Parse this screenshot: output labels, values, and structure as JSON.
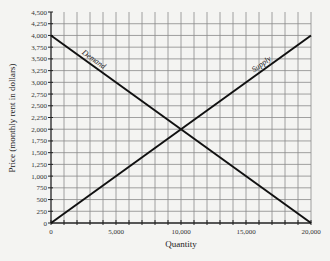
{
  "chart_data": {
    "type": "line",
    "title": "",
    "xlabel": "Quantity",
    "ylabel": "Price (monthly rent in dollars)",
    "xlim": [
      0,
      20000
    ],
    "ylim": [
      0,
      4500
    ],
    "x_ticks": [
      0,
      5000,
      10000,
      15000,
      20000
    ],
    "x_tick_labels": [
      "0",
      "5,000",
      "10,000",
      "15,000",
      "20,000"
    ],
    "x_minor_step": 1000,
    "y_ticks": [
      0,
      250,
      500,
      750,
      1000,
      1250,
      1500,
      1750,
      2000,
      2250,
      2500,
      2750,
      3000,
      3250,
      3500,
      3750,
      4000,
      4250,
      4500
    ],
    "y_tick_labels": [
      "0",
      "250",
      "500",
      "750",
      "1,000",
      "1,250",
      "1,500",
      "1,750",
      "2,000",
      "2,250",
      "2,500",
      "2,750",
      "3,000",
      "3,250",
      "3,500",
      "3,750",
      "4,000",
      "4,250",
      "4,500"
    ],
    "grid": true,
    "legend": "none (curves labeled inline)",
    "series": [
      {
        "name": "Demand",
        "x": [
          0,
          20000
        ],
        "y": [
          4000,
          0
        ]
      },
      {
        "name": "Supply",
        "x": [
          0,
          20000
        ],
        "y": [
          0,
          4000
        ]
      }
    ],
    "annotations": [
      {
        "text": "Demand",
        "position": "along demand curve near upper left"
      },
      {
        "text": "Supply",
        "position": "along supply curve near upper right"
      }
    ],
    "equilibrium": {
      "quantity": 10000,
      "price": 2000
    }
  },
  "colors": {
    "background": "#f4f4f2",
    "grid": "#8a8a8a",
    "axis": "#222222",
    "curve": "#111111"
  }
}
